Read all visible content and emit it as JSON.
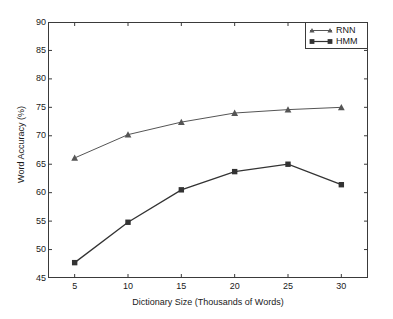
{
  "chart_data": {
    "type": "line",
    "title": "",
    "xlabel": "Dictionary Size (Thousands of Words)",
    "ylabel": "Word Accuracy (%)",
    "x": [
      5,
      10,
      15,
      20,
      25,
      30
    ],
    "xticklabels": [
      "5",
      "10",
      "15",
      "20",
      "25",
      "30"
    ],
    "yticklabels": [
      "45",
      "50",
      "55",
      "60",
      "65",
      "70",
      "75",
      "80",
      "85",
      "90"
    ],
    "yticks": [
      45,
      50,
      55,
      60,
      65,
      70,
      75,
      80,
      85,
      90
    ],
    "xlim": [
      2.5,
      32.5
    ],
    "ylim": [
      45,
      90
    ],
    "grid": false,
    "legend_position": "top-right",
    "series": [
      {
        "name": "RNN",
        "marker": "triangle",
        "color": "#555555",
        "values": [
          66.1,
          70.2,
          72.4,
          74.0,
          74.6,
          75.0
        ]
      },
      {
        "name": "HMM",
        "marker": "square",
        "color": "#333333",
        "values": [
          47.7,
          54.8,
          60.5,
          63.7,
          65.0,
          61.4
        ]
      }
    ]
  },
  "legend": {
    "entries": [
      {
        "label": "RNN"
      },
      {
        "label": "HMM"
      }
    ]
  }
}
